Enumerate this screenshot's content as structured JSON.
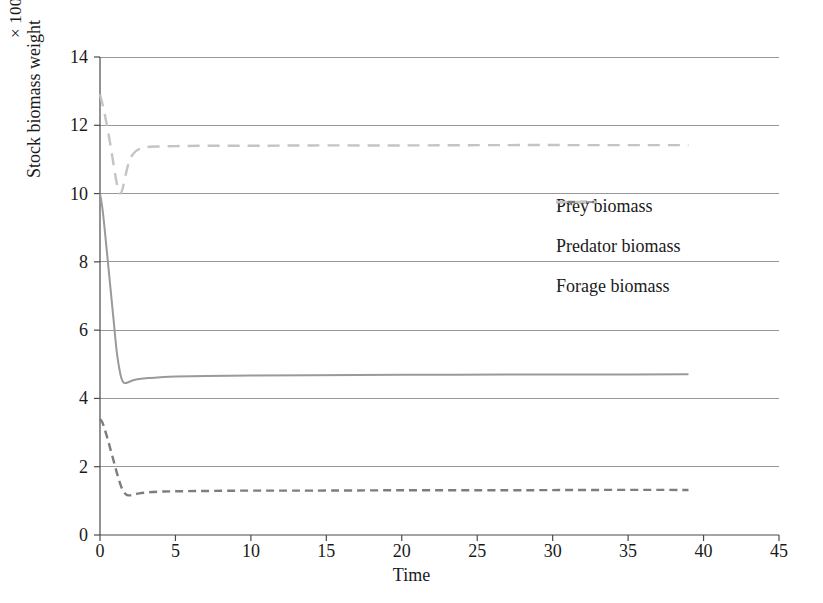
{
  "chart_data": {
    "type": "line",
    "title": "",
    "xlabel": "Time",
    "ylabel": "Stock biomass weight",
    "y_unit_label": "× 100000",
    "xlim": [
      0,
      45
    ],
    "ylim": [
      0,
      14
    ],
    "xticks": [
      0,
      5,
      10,
      15,
      20,
      25,
      30,
      35,
      40,
      45
    ],
    "yticks": [
      0,
      2,
      4,
      6,
      8,
      10,
      12,
      14
    ],
    "grid": "horizontal",
    "legend_position": "center-right",
    "series": [
      {
        "name": "Prey biomass",
        "style": "solid",
        "color": "#9a9a9a",
        "x": [
          0,
          0.15,
          0.3,
          0.5,
          0.7,
          0.9,
          1.1,
          1.25,
          1.4,
          1.55,
          1.7,
          1.9,
          2.2,
          2.6,
          3.2,
          4,
          5,
          7,
          10,
          14,
          20,
          27,
          33,
          39
        ],
        "y": [
          10.0,
          9.6,
          9.0,
          8.1,
          7.2,
          6.3,
          5.4,
          4.95,
          4.62,
          4.47,
          4.45,
          4.48,
          4.53,
          4.57,
          4.6,
          4.62,
          4.64,
          4.66,
          4.67,
          4.68,
          4.69,
          4.7,
          4.7,
          4.71
        ]
      },
      {
        "name": "Predator biomass",
        "style": "dashed-short",
        "color": "#7d7d7d",
        "x": [
          0,
          0.15,
          0.3,
          0.5,
          0.7,
          0.9,
          1.1,
          1.3,
          1.5,
          1.7,
          1.9,
          2.2,
          2.6,
          3.2,
          4,
          5,
          7,
          10,
          14,
          20,
          27,
          33,
          39
        ],
        "y": [
          3.4,
          3.3,
          3.12,
          2.82,
          2.5,
          2.18,
          1.85,
          1.55,
          1.32,
          1.2,
          1.16,
          1.18,
          1.22,
          1.25,
          1.27,
          1.28,
          1.29,
          1.3,
          1.3,
          1.31,
          1.31,
          1.32,
          1.32
        ]
      },
      {
        "name": "Forage biomass",
        "style": "dashed-long",
        "color": "#c4c4c4",
        "x": [
          0,
          0.15,
          0.3,
          0.5,
          0.7,
          0.9,
          1.05,
          1.2,
          1.35,
          1.5,
          1.7,
          1.9,
          2.1,
          2.4,
          2.8,
          3.3,
          4,
          5,
          7,
          10,
          14,
          20,
          27,
          33,
          39
        ],
        "y": [
          12.9,
          12.65,
          12.35,
          11.9,
          11.4,
          10.85,
          10.45,
          10.12,
          10.0,
          10.15,
          10.55,
          10.9,
          11.1,
          11.25,
          11.33,
          11.37,
          11.38,
          11.39,
          11.4,
          11.4,
          11.41,
          11.41,
          11.42,
          11.42,
          11.42
        ]
      }
    ]
  },
  "legend": {
    "items": [
      {
        "label": "Prey biomass"
      },
      {
        "label": "Predator biomass"
      },
      {
        "label": "Forage biomass"
      }
    ]
  },
  "colors": {
    "axis": "#4a4a4a",
    "grid": "#8c8c8c",
    "text": "#1a1a1a",
    "prey": "#9a9a9a",
    "predator": "#7d7d7d",
    "forage": "#c4c4c4"
  }
}
